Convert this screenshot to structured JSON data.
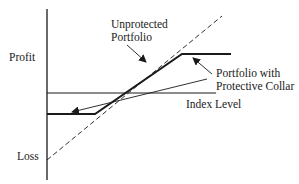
{
  "diagram": {
    "axes": {
      "y_top_label": "Profit",
      "y_bottom_label": "Loss",
      "x_label": "Index Level"
    },
    "annotations": {
      "unprotected_line1": "Unprotected",
      "unprotected_line2": "Portfolio",
      "collar_line1": "Portfolio with",
      "collar_line2": "Protective Collar"
    },
    "colors": {
      "line": "#1a1a1a",
      "background": "#ffffff"
    },
    "series": [
      {
        "name": "Unprotected Portfolio",
        "style": "dashed",
        "shape": "linear"
      },
      {
        "name": "Portfolio with Protective Collar",
        "style": "solid-bold",
        "shape": "floor-ramp-cap"
      }
    ]
  }
}
